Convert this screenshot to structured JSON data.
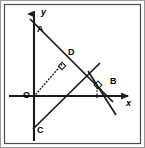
{
  "figure": {
    "kind": "coordinate-geometry-diagram",
    "background_color": "#ffffff",
    "stroke_color": "#1a1a1a",
    "frame": {
      "outer_color": "#9a9a9a",
      "inner_color": "#4d4d4d",
      "label": "diagram-border"
    },
    "axes": {
      "x_axis": {
        "label": "x",
        "label_x": 126,
        "label_y": 99,
        "y_pixel": 96,
        "x_start": 9,
        "x_end": 134,
        "arrow": "right"
      },
      "y_axis": {
        "label": "y",
        "label_x": 41,
        "label_y": 8,
        "x_pixel": 34,
        "y_start": 10,
        "y_end": 141,
        "arrow": "up"
      }
    },
    "points": [
      {
        "name": "A",
        "label": "A",
        "px": 34,
        "py": 23,
        "label_x": 37,
        "label_y": 25,
        "on": "y-axis-positive"
      },
      {
        "name": "B",
        "label": "B",
        "px": 107,
        "py": 96,
        "label_x": 110,
        "label_y": 77,
        "on": "x-axis-positive"
      },
      {
        "name": "C",
        "label": "C",
        "px": 34,
        "py": 124,
        "label_x": 37,
        "label_y": 126,
        "on": "y-axis-negative"
      },
      {
        "name": "D",
        "label": "D",
        "px": 64,
        "py": 62,
        "label_x": 68,
        "label_y": 48,
        "on": "segment-AB"
      },
      {
        "name": "O",
        "label": "O",
        "px": 34,
        "py": 96,
        "label_x": 23,
        "label_y": 98,
        "on": "origin"
      }
    ],
    "segments": [
      {
        "name": "line-AB",
        "x1": 30,
        "y1": 19,
        "x2": 113,
        "y2": 102,
        "style": "solid"
      },
      {
        "name": "line-through-C",
        "x1": 33,
        "y1": 129,
        "x2": 100,
        "y2": 63,
        "style": "solid"
      },
      {
        "name": "perpendicular-at-B",
        "x1": 88,
        "y1": 71,
        "x2": 116,
        "y2": 115,
        "style": "solid"
      },
      {
        "name": "segment-OD-dotted",
        "x1": 35,
        "y1": 95,
        "x2": 63,
        "y2": 63,
        "style": "dotted"
      },
      {
        "name": "tick-dotted-below",
        "x1": 97,
        "y1": 89,
        "x2": 97,
        "y2": 99,
        "style": "dotted"
      }
    ],
    "right_angle_marks": [
      {
        "name": "right-angle-at-D",
        "cx": 62,
        "cy": 66,
        "rotation": -45
      },
      {
        "name": "right-angle-at-intersection-near-B",
        "cx": 97,
        "cy": 85,
        "rotation": -45
      }
    ]
  }
}
